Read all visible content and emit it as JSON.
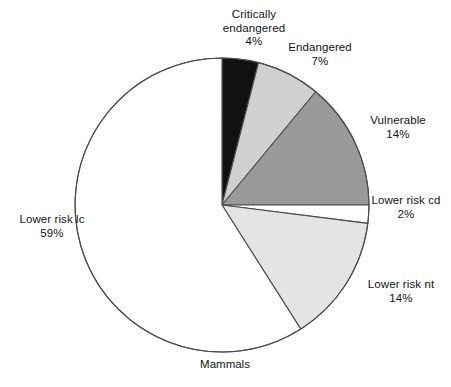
{
  "chart_data": {
    "type": "pie",
    "title": "Mammals",
    "subtitle": "",
    "xlabel": "",
    "ylabel": "",
    "legend_position": "none",
    "grid": false,
    "units": "percent",
    "start_angle_deg": 0,
    "direction": "clockwise",
    "categories": [
      "Critically endangered",
      "Endangered",
      "Vulnerable",
      "Lower risk cd",
      "Lower risk nt",
      "Lower risk lc"
    ],
    "values": [
      4,
      7,
      14,
      2,
      14,
      59
    ],
    "value_labels": [
      "4%",
      "7%",
      "14%",
      "2%",
      "14%",
      "59%"
    ],
    "colors": [
      "#111111",
      "#d0d0d0",
      "#9a9a9a",
      "#ffffff",
      "#e4e4e4",
      "#ffffff"
    ],
    "stroke": "#4d4d4d",
    "slices": [
      {
        "name": "Critically endangered",
        "value": 4,
        "value_label": "4%",
        "color": "#111111"
      },
      {
        "name": "Endangered",
        "value": 7,
        "value_label": "7%",
        "color": "#d0d0d0"
      },
      {
        "name": "Vulnerable",
        "value": 14,
        "value_label": "14%",
        "color": "#9a9a9a"
      },
      {
        "name": "Lower risk cd",
        "value": 2,
        "value_label": "2%",
        "color": "#ffffff"
      },
      {
        "name": "Lower risk nt",
        "value": 14,
        "value_label": "14%",
        "color": "#e4e4e4"
      },
      {
        "name": "Lower risk lc",
        "value": 59,
        "value_label": "59%",
        "color": "#ffffff"
      }
    ]
  },
  "labels": {
    "critically_endangered": {
      "name_line1": "Critically",
      "name_line2": "endangered",
      "value": "4%"
    },
    "endangered": {
      "name": "Endangered",
      "value": "7%"
    },
    "vulnerable": {
      "name": "Vulnerable",
      "value": "14%"
    },
    "lower_risk_cd": {
      "name": "Lower risk cd",
      "value": "2%"
    },
    "lower_risk_nt": {
      "name": "Lower risk nt",
      "value": "14%"
    },
    "lower_risk_lc": {
      "name": "Lower risk lc",
      "value": "59%"
    }
  },
  "caption": {
    "text": "Mammals"
  },
  "geometry": {
    "cx": 222,
    "cy": 205,
    "r": 147
  }
}
